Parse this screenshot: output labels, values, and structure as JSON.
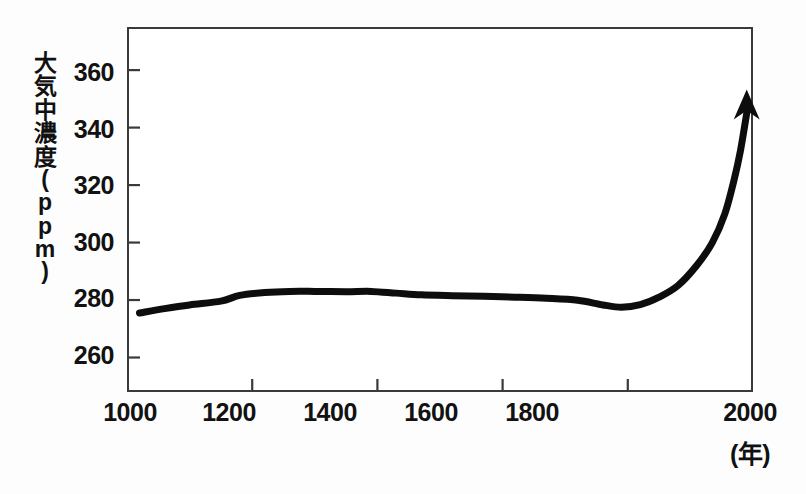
{
  "chart_data": {
    "type": "line",
    "title": "",
    "subtitle": "",
    "xlabel": "(年)",
    "ylabel": "大気中濃度(ppm)",
    "ylabel_chars": [
      "大",
      "気",
      "中",
      "濃",
      "度",
      "(",
      "p",
      "p",
      "m",
      ")"
    ],
    "x": [
      1020,
      1060,
      1100,
      1150,
      1180,
      1220,
      1260,
      1300,
      1350,
      1390,
      1430,
      1470,
      1520,
      1570,
      1620,
      1670,
      1720,
      1760,
      1790,
      1820,
      1850,
      1880,
      1910,
      1935,
      1955,
      1970,
      1980,
      1990
    ],
    "values": [
      275.5,
      277.0,
      278.3,
      279.6,
      281.6,
      282.6,
      283.0,
      283.0,
      282.9,
      283.0,
      282.4,
      281.8,
      281.5,
      281.3,
      281.0,
      280.6,
      279.9,
      278.3,
      277.5,
      278.4,
      281.0,
      285.0,
      292.0,
      300.0,
      310.0,
      322.0,
      332.0,
      345.0
    ],
    "xlim": [
      1000,
      2000
    ],
    "ylim": [
      248,
      375
    ],
    "xticks": [
      1000,
      1200,
      1400,
      1600,
      1800,
      2000
    ],
    "xtick_labels": [
      "1000",
      "1200",
      "1400",
      "1600",
      "1800",
      "2000"
    ],
    "yticks": [
      260,
      280,
      300,
      320,
      340,
      360
    ],
    "ytick_labels": [
      "260",
      "280",
      "300",
      "320",
      "340",
      "360"
    ],
    "grid": false,
    "legend": null,
    "line_color": "#0d0d0d",
    "line_width_px": 7,
    "marker": "arrow-end",
    "annotations": [
      {
        "name": "arrow-head",
        "at_x": 1990,
        "at_y": 347,
        "direction": "up"
      }
    ]
  },
  "axes": {
    "frame_color": "#3a3a3a",
    "background": "#ffffff"
  }
}
